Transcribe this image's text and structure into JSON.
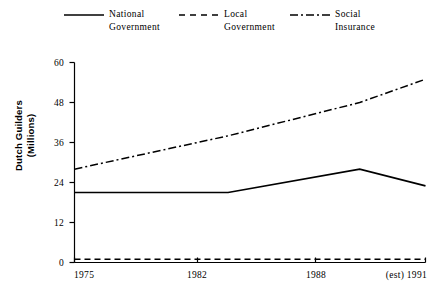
{
  "chart_data": {
    "type": "line",
    "title": "",
    "xlabel": "",
    "ylabel": "Dutch Guilders\n(Millions)",
    "x": [
      1975,
      1982,
      1988,
      1991
    ],
    "categories": [
      "1975",
      "1982",
      "1988",
      "(est) 1991"
    ],
    "xlim": [
      1975,
      1991
    ],
    "ylim": [
      0,
      60
    ],
    "yticks": [
      0,
      12,
      24,
      36,
      48,
      60
    ],
    "ytick_labels": [
      "0",
      "12",
      "24",
      "36",
      "48",
      "60"
    ],
    "grid": false,
    "legend_position": "top",
    "series": [
      {
        "name": "National\nGovernment",
        "label": "National Government",
        "style": "solid",
        "color": "#000000",
        "values": [
          21,
          21,
          28,
          23
        ]
      },
      {
        "name": "Local\nGovernment",
        "label": "Local Government",
        "style": "dashed",
        "color": "#000000",
        "values": [
          1,
          1,
          1,
          1
        ]
      },
      {
        "name": "Social\nInsurance",
        "label": "Social Insurance",
        "style": "dashdot",
        "color": "#000000",
        "values": [
          28,
          38,
          48,
          55
        ]
      }
    ]
  },
  "axes": {
    "y_title": "Dutch Guilders\n(Millions)",
    "y_tick_0": "0",
    "y_tick_1": "12",
    "y_tick_2": "24",
    "y_tick_3": "36",
    "y_tick_4": "48",
    "y_tick_5": "60",
    "x_tick_0": "1975",
    "x_tick_1": "1982",
    "x_tick_2": "1988",
    "x_tick_3": "(est) 1991"
  },
  "legend": {
    "items": [
      {
        "label": "National\nGovernment",
        "style": "solid",
        "icon": "solid-line-icon"
      },
      {
        "label": "Local\nGovernment",
        "style": "dashed",
        "icon": "dashed-line-icon"
      },
      {
        "label": "Social\nInsurance",
        "style": "dashdot",
        "icon": "dashdot-line-icon"
      }
    ]
  }
}
